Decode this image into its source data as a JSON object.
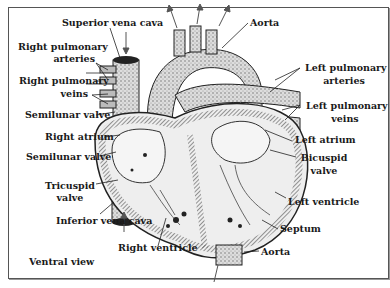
{
  "diagram": {
    "title": "Ventral view",
    "labels": {
      "superior_vena_cava": "Superior vena cava",
      "right_pulmonary_arteries_1": "Right pulmonary",
      "right_pulmonary_arteries_2": "arteries",
      "right_pulmonary_veins_1": "Right pulmonary",
      "right_pulmonary_veins_2": "veins",
      "semilunar_valve_upper": "Semilunar valve",
      "right_atrium": "Right atrium",
      "semilunar_valve_lower": "Semilunar valve",
      "tricuspid_valve_1": "Tricuspid",
      "tricuspid_valve_2": "valve",
      "inferior_vena_cava": "Inferior vena cava",
      "right_ventricle": "Right ventricle",
      "aorta_top": "Aorta",
      "left_pulmonary_arteries_1": "Left pulmonary",
      "left_pulmonary_arteries_2": "arteries",
      "left_pulmonary_veins_1": "Left pulmonary",
      "left_pulmonary_veins_2": "veins",
      "left_atrium": "Left atrium",
      "bicuspid_valve_1": "Bicuspid",
      "bicuspid_valve_2": "valve",
      "left_ventricle": "Left ventricle",
      "septum": "Septum",
      "aorta_bottom": "Aorta"
    }
  }
}
